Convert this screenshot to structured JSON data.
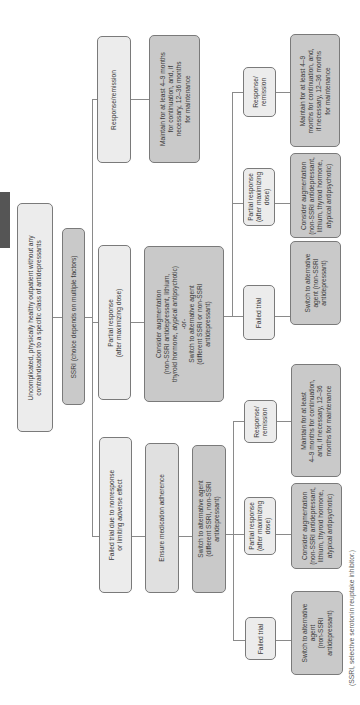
{
  "diagram": {
    "root": "Uncomplicated, physically healthy outpatient without any\ncontraindication to a specific class of antidepressants",
    "start": "SSRI (choice depends on multiple factors)",
    "branches": {
      "response": {
        "label": "Response/remission",
        "action": "Maintain for at least 4–9 months\nfor continuation, and, if\nnecessary, 12–36 months\nfor maintenance"
      },
      "partial": {
        "label": "Partial response\n(after maximizing dose)",
        "action": "Consider augmentation\n(non-SSRI antidepressant, lithium,\nthyroid hormone, atypical antipsychotic)\n-or-\nSwitch to alternative agent\n(different SSRI or non-SSRI\nantidepressant)",
        "sub": {
          "response": {
            "label": "Response/\nremission",
            "action": "Maintain for at least 4–9\nmonths for continuation, and,\nif necessary, 12–36 months\nfor maintenance"
          },
          "partial": {
            "label": "Partial response\n(after maximizing\ndose)",
            "action": "Consider augmentation\n(non-SSRI antidepressant,\nlithium, thyroid hormone,\natypical antipsychotic)"
          },
          "failed": {
            "label": "Failed trial",
            "action": "Switch to alternative\nagent (non-SSRI\nantidepressant)"
          }
        }
      },
      "failed": {
        "label": "Failed trial due to nonresponse\nor limiting adverse effect",
        "step1": "Ensure medication adherence",
        "step2": "Switch to alternative agent\n(different SSRI, non-SSRI\nantidepressant)",
        "sub": {
          "response": {
            "label": "Response/\nremission",
            "action": "Maintain for at least\n4–9 months for continuation,\nand, if necessary, 12–36\nmonths for maintenance"
          },
          "partial": {
            "label": "Partial response\n(after maximizing\ndose)",
            "action": "Consider augmentation\n(non-SSRI antidepressant,\nlithium, thyroid hormone,\natypical antipsychotic)"
          },
          "failed": {
            "label": "Failed trial",
            "action": "Switch to alternative\nagent\n(non-SSRI\nantidepressant)"
          }
        }
      }
    },
    "footnote": "(SSRI, selective serotonin reuptake inhibitor.)"
  },
  "colors": {
    "light_box": "#ececec",
    "dark_box": "#c9c9c9",
    "border": "#7a7a7a",
    "tab": "#555555"
  }
}
